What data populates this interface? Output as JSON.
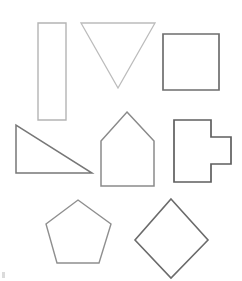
{
  "sheet": {
    "title": "Geometric shapes worksheet",
    "background_color": "#ffffff",
    "width": 242,
    "height": 281
  },
  "chart_data": {
    "type": "diagram",
    "grid": {
      "rows": 3,
      "columns": 3,
      "note": "row 1 has 3 shapes, row 2 has 3 shapes, row 3 has 2 shapes"
    },
    "shapes": [
      {
        "id": "rectangle",
        "name": "Tall rectangle",
        "sides": 4,
        "row": 1,
        "column": 1,
        "stroke_color": "#b4b4b4",
        "stroke_width": 1.4,
        "fill_color": "#ffffff",
        "points": "38,23 66,23 66,120 38,120",
        "bbox": {
          "x": 38,
          "y": 23,
          "width": 28,
          "height": 97
        }
      },
      {
        "id": "inverted-triangle",
        "name": "Inverted triangle",
        "sides": 3,
        "row": 1,
        "column": 2,
        "stroke_color": "#bcbcbc",
        "stroke_width": 1.3,
        "fill_color": "#ffffff",
        "points": "81,23 155,23 118,88",
        "bbox": {
          "x": 81,
          "y": 23,
          "width": 74,
          "height": 65
        }
      },
      {
        "id": "square",
        "name": "Square",
        "sides": 4,
        "row": 1,
        "column": 3,
        "stroke_color": "#6e6e6e",
        "stroke_width": 1.7,
        "fill_color": "#ffffff",
        "points": "163,34 219,34 219,90 163,90",
        "bbox": {
          "x": 163,
          "y": 34,
          "width": 56,
          "height": 56
        }
      },
      {
        "id": "right-triangle",
        "name": "Right triangle",
        "sides": 3,
        "row": 2,
        "column": 1,
        "stroke_color": "#777777",
        "stroke_width": 1.5,
        "fill_color": "#ffffff",
        "points": "16,125 16,173 92,173",
        "bbox": {
          "x": 16,
          "y": 125,
          "width": 76,
          "height": 48
        }
      },
      {
        "id": "house-pentagon",
        "name": "House pentagon",
        "sides": 5,
        "row": 2,
        "column": 2,
        "stroke_color": "#8a8a8a",
        "stroke_width": 1.5,
        "fill_color": "#ffffff",
        "points": "127,112 154,141 154,186 101,186 101,141",
        "bbox": {
          "x": 101,
          "y": 112,
          "width": 53,
          "height": 74
        }
      },
      {
        "id": "t-shape",
        "name": "T-shaped polygon",
        "sides": 8,
        "row": 2,
        "column": 3,
        "stroke_color": "#5f5f5f",
        "stroke_width": 1.7,
        "fill_color": "#ffffff",
        "points": "174,120 211,120 211,137 231,137 231,164 211,164 211,182 174,182",
        "bbox": {
          "x": 174,
          "y": 120,
          "width": 57,
          "height": 62
        }
      },
      {
        "id": "pentagon",
        "name": "Regular pentagon",
        "sides": 5,
        "row": 3,
        "column": 1,
        "stroke_color": "#8f8f8f",
        "stroke_width": 1.4,
        "fill_color": "#ffffff",
        "points": "78,200 111,224 99,263 57,263 46,224",
        "bbox": {
          "x": 46,
          "y": 200,
          "width": 65,
          "height": 63
        }
      },
      {
        "id": "diamond",
        "name": "Diamond (rotated square)",
        "sides": 4,
        "row": 3,
        "column": 2,
        "stroke_color": "#6b6b6b",
        "stroke_width": 1.6,
        "fill_color": "#ffffff",
        "points": "171,199 208,240 171,278 135,240",
        "bbox": {
          "x": 135,
          "y": 199,
          "width": 73,
          "height": 79
        }
      }
    ],
    "artifacts": [
      {
        "id": "corner-speck",
        "name": "Scan speck at bottom-left corner",
        "color": "#cfcfcf",
        "x": 2,
        "y": 272
      }
    ]
  }
}
